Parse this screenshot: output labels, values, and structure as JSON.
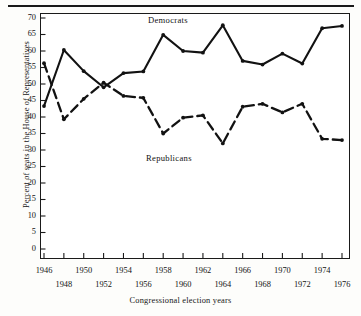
{
  "figure": {
    "background_color": "#fdfdfb",
    "ink_color": "#1a1a1a"
  },
  "axes": {
    "y_title": "Percent of seats in the House of Representatives",
    "x_title": "Congressional election years",
    "y_ticks": [
      "0",
      "5",
      "10",
      "15",
      "20",
      "25",
      "30",
      "35",
      "40",
      "45",
      "50",
      "55",
      "60",
      "65",
      "70"
    ],
    "x_ticks_top_row": [
      "1946",
      "1950",
      "1954",
      "1958",
      "1962",
      "1966",
      "1970",
      "1974"
    ],
    "x_ticks_bottom_row": [
      "1948",
      "1952",
      "1956",
      "1960",
      "1964",
      "1968",
      "1972",
      "1976"
    ]
  },
  "annotations": {
    "democrats": "Democrats",
    "republicans": "Republicans"
  },
  "chart_data": {
    "type": "line",
    "title": "",
    "subtitle": "",
    "xlabel": "Congressional election years",
    "ylabel": "Percent of seats in the House of Representatives",
    "xlim": [
      1945,
      1977
    ],
    "ylim": [
      0,
      72
    ],
    "ytick_values": [
      0,
      5,
      10,
      15,
      20,
      25,
      30,
      35,
      40,
      45,
      50,
      55,
      60,
      65,
      70
    ],
    "xtick_values": [
      1946,
      1948,
      1950,
      1952,
      1954,
      1956,
      1958,
      1960,
      1962,
      1964,
      1966,
      1968,
      1970,
      1972,
      1974,
      1976
    ],
    "grid": false,
    "legend_position": "inline-annotation",
    "x": [
      1946,
      1948,
      1950,
      1952,
      1954,
      1956,
      1958,
      1960,
      1962,
      1964,
      1966,
      1968,
      1970,
      1972,
      1974,
      1976
    ],
    "series": [
      {
        "name": "Democrats",
        "style": "solid",
        "color": "#121212",
        "marker": "circle",
        "values": [
          43.3,
          60.3,
          53.9,
          49.0,
          53.3,
          53.8,
          64.9,
          60.0,
          59.5,
          67.8,
          57.0,
          55.9,
          59.2,
          56.2,
          66.9,
          67.6
        ]
      },
      {
        "name": "Republicans",
        "style": "dashed",
        "color": "#121212",
        "marker": "circle",
        "values": [
          56.3,
          39.3,
          45.5,
          50.4,
          46.4,
          45.8,
          35.0,
          39.8,
          40.5,
          32.0,
          43.1,
          44.0,
          41.4,
          44.0,
          33.4,
          33.0
        ]
      }
    ]
  }
}
